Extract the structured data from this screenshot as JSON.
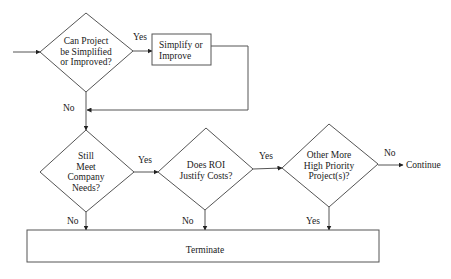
{
  "diagram": {
    "type": "flowchart",
    "colors": {
      "line": "#555555",
      "text": "#1a1a1a",
      "background": "#ffffff"
    },
    "nodes": {
      "q1": {
        "kind": "decision",
        "lines": [
          "Can Project",
          "be Simplified",
          "or Improved?"
        ]
      },
      "simplify": {
        "kind": "process",
        "lines": [
          "Simplify or",
          "Improve"
        ]
      },
      "q2": {
        "kind": "decision",
        "lines": [
          "Still",
          "Meet",
          "Company",
          "Needs?"
        ]
      },
      "q3": {
        "kind": "decision",
        "lines": [
          "Does ROI",
          "Justify Costs?"
        ]
      },
      "q4": {
        "kind": "decision",
        "lines": [
          "Other More",
          "High Priority",
          "Project(s)?"
        ]
      },
      "continue": {
        "kind": "terminal",
        "label": "Continue"
      },
      "terminate": {
        "kind": "process",
        "label": "Terminate"
      }
    },
    "edges": {
      "q1_yes": "Yes",
      "q1_no": "No",
      "q2_yes": "Yes",
      "q2_no": "No",
      "q3_yes": "Yes",
      "q3_no": "No",
      "q4_no": "No",
      "q4_yes": "Yes"
    }
  }
}
